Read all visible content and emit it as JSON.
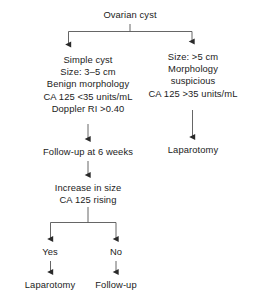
{
  "diagram": {
    "colors": {
      "text": "#1b1b1b",
      "connector": "#555555",
      "background": "#ffffff"
    },
    "nodes": {
      "root": {
        "lines": [
          "Ovarian cyst"
        ]
      },
      "simple_cyst": {
        "lines": [
          "Simple cyst",
          "Size: 3–5 cm",
          "Benign morphology",
          "CA 125 <35 units/mL",
          "Doppler RI >0.40"
        ]
      },
      "suspicious_cyst": {
        "lines": [
          "Size: >5 cm",
          "Morphology",
          "suspicious",
          "CA 125 >35 units/mL"
        ]
      },
      "laparotomy_right": {
        "lines": [
          "Laparotomy"
        ]
      },
      "follow_up_6_weeks": {
        "lines": [
          "Follow-up at 6 weeks"
        ]
      },
      "increase_in_size": {
        "lines": [
          "Increase in size",
          "CA 125 rising"
        ]
      },
      "yes": {
        "lines": [
          "Yes"
        ]
      },
      "no": {
        "lines": [
          "No"
        ]
      },
      "laparotomy_bottom": {
        "lines": [
          "Laparotomy"
        ]
      },
      "follow_up_bottom": {
        "lines": [
          "Follow-up"
        ]
      }
    },
    "edges": [
      {
        "from": "root",
        "to": "simple_cyst",
        "label": ""
      },
      {
        "from": "root",
        "to": "suspicious_cyst",
        "label": ""
      },
      {
        "from": "simple_cyst",
        "to": "follow_up_6_weeks",
        "label": ""
      },
      {
        "from": "suspicious_cyst",
        "to": "laparotomy_right",
        "label": ""
      },
      {
        "from": "follow_up_6_weeks",
        "to": "increase_in_size",
        "label": ""
      },
      {
        "from": "increase_in_size",
        "to": "yes",
        "label": "Yes"
      },
      {
        "from": "increase_in_size",
        "to": "no",
        "label": "No"
      },
      {
        "from": "yes",
        "to": "laparotomy_bottom",
        "label": ""
      },
      {
        "from": "no",
        "to": "follow_up_bottom",
        "label": ""
      }
    ]
  }
}
